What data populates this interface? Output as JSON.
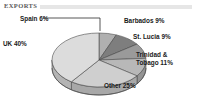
{
  "header": {
    "title": "EXPORTS",
    "rule_color": "#e6e6e6"
  },
  "chart_data": {
    "type": "pie",
    "title": "EXPORTS",
    "xlabel": "",
    "ylabel": "",
    "legend_position": "none",
    "grid": false,
    "three_d": true,
    "start_angle_deg": 270,
    "direction": "clockwise",
    "categories": [
      "Spain",
      "Barbados",
      "St. Lucia",
      "Trinidad & Tobago",
      "Other",
      "UK"
    ],
    "values": [
      6,
      9,
      9,
      11,
      25,
      40
    ],
    "value_unit": "%",
    "slices": [
      {
        "name": "Spain",
        "label": "Spain 6%",
        "value": 6,
        "color": "#b0b0b0",
        "side_color": "#909090"
      },
      {
        "name": "Barbados",
        "label": "Barbados 9%",
        "value": 9,
        "color": "#7e7e7e",
        "side_color": "#666666"
      },
      {
        "name": "St. Lucia",
        "label": "St. Lucia 9%",
        "value": 9,
        "color": "#9a9a9a",
        "side_color": "#7c7c7c"
      },
      {
        "name": "Trinidad & Tobago",
        "label": "Trinidad & Tobago 11%",
        "label_line1": "Trinidad &",
        "label_line2": "Tobago 11%",
        "value": 11,
        "color": "#b8b8b8",
        "side_color": "#949494"
      },
      {
        "name": "Other",
        "label": "Other 25%",
        "value": 25,
        "color": "#cfcfcf",
        "side_color": "#a8a8a8"
      },
      {
        "name": "UK",
        "label": "UK 40%",
        "value": 40,
        "color": "#dcdcdc",
        "side_color": "#b4b4b4"
      }
    ],
    "labels": {
      "spain": "Spain 6%",
      "uk": "UK 40%",
      "barbados": "Barbados 9%",
      "st_lucia": "St. Lucia 9%",
      "trinidad_line1": "Trinidad &",
      "trinidad_line2": "Tobago 11%",
      "other": "Other 25%"
    },
    "colors": {
      "outline": "#4a4a4a",
      "leader_line": "#2b2b2b",
      "background": "#ffffff",
      "label_text": "#1a1a1a"
    }
  }
}
